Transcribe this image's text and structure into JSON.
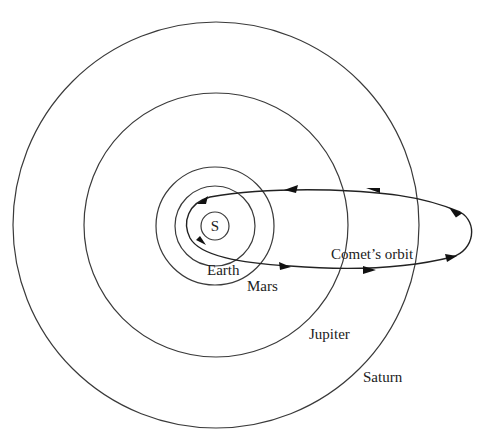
{
  "diagram": {
    "sun": {
      "label": "S"
    },
    "orbits": [
      {
        "name": "Earth",
        "label": "Earth"
      },
      {
        "name": "Mars",
        "label": "Mars"
      },
      {
        "name": "Jupiter",
        "label": "Jupiter"
      },
      {
        "name": "Saturn",
        "label": "Saturn"
      }
    ],
    "comet": {
      "label": "Comet’s orbit"
    },
    "colors": {
      "line": "#3a3a3a",
      "background": "#ffffff"
    }
  }
}
